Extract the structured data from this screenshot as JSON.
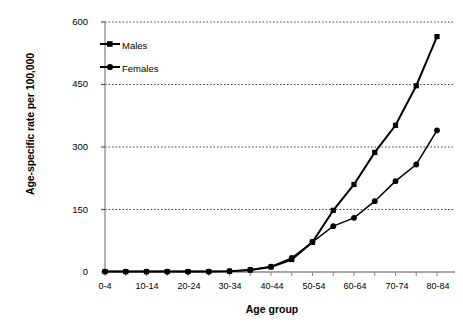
{
  "chart_data": {
    "type": "line",
    "title": "",
    "xlabel": "Age group",
    "ylabel": "Age-specific rate per 100,000",
    "categories": [
      "0-4",
      "5-9",
      "10-14",
      "15-19",
      "20-24",
      "25-29",
      "30-34",
      "35-39",
      "40-44",
      "45-49",
      "50-54",
      "55-59",
      "60-64",
      "65-69",
      "70-74",
      "75-79",
      "80-84"
    ],
    "xtick_labels": [
      "0-4",
      "10-14",
      "20-24",
      "30-34",
      "40-44",
      "50-54",
      "60-64",
      "70-74",
      "80-84"
    ],
    "ylim": [
      0,
      600
    ],
    "yticks": [
      0,
      150,
      300,
      450,
      600
    ],
    "grid": "horizontal-dotted",
    "legend_position": "top-left-inside",
    "series": [
      {
        "name": "Males",
        "marker": "square",
        "color": "#000000",
        "values": [
          1,
          1,
          1,
          1,
          1,
          1,
          2,
          5,
          12,
          30,
          72,
          148,
          210,
          287,
          352,
          447,
          565
        ]
      },
      {
        "name": "Females",
        "marker": "circle",
        "color": "#000000",
        "values": [
          1,
          1,
          1,
          1,
          1,
          1,
          2,
          5,
          13,
          34,
          72,
          110,
          130,
          170,
          218,
          258,
          340
        ]
      }
    ]
  },
  "axis": {
    "y_tick_labels": [
      "600",
      "450",
      "300",
      "150",
      "0"
    ],
    "y_title": "Age-specific rate per 100,000",
    "x_title": "Age group"
  },
  "legend": {
    "items": [
      {
        "label": "Males",
        "marker": "square"
      },
      {
        "label": "Females",
        "marker": "circle"
      }
    ]
  }
}
